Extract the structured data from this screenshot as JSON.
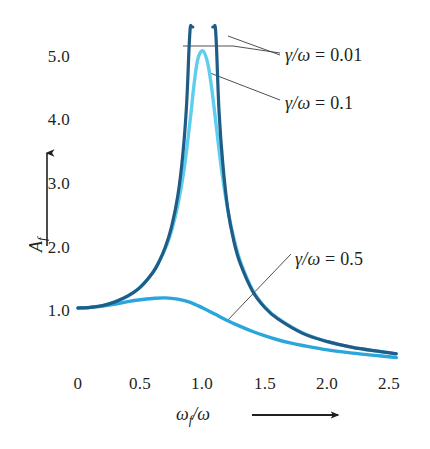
{
  "chart_data": {
    "type": "line",
    "title": "",
    "xlabel": "ωf/ω",
    "ylabel": "Af",
    "xlim": [
      0,
      2.6
    ],
    "ylim": [
      0,
      5.6
    ],
    "grid": false,
    "legend_position": "inline-annotations",
    "x_ticks": [
      "0",
      "0.5",
      "1.0",
      "1.5",
      "2.0",
      "2.5"
    ],
    "x_tick_values": [
      0,
      0.5,
      1.0,
      1.5,
      2.0,
      2.5
    ],
    "y_ticks": [
      "1.0",
      "2.0",
      "3.0",
      "4.0",
      "5.0"
    ],
    "y_tick_values": [
      1.0,
      2.0,
      3.0,
      4.0,
      5.0
    ],
    "series": [
      {
        "name": "γ/ω = 0.01",
        "gamma_over_omega": 0.01,
        "color": "#1f5c86",
        "peak_x": 1.0,
        "peak_y": 50.0,
        "clipped_at_top": true,
        "x": [
          0.0,
          0.1,
          0.2,
          0.3,
          0.4,
          0.5,
          0.6,
          0.65,
          0.7,
          0.75,
          0.8,
          0.84,
          0.87,
          0.89,
          0.9,
          0.91,
          0.92,
          1.08,
          1.09,
          1.1,
          1.11,
          1.13,
          1.16,
          1.2,
          1.25,
          1.3,
          1.4,
          1.5,
          1.6,
          1.8,
          2.0,
          2.2,
          2.4,
          2.55
        ],
        "y": [
          1.0,
          1.01,
          1.04,
          1.1,
          1.19,
          1.33,
          1.56,
          1.73,
          1.96,
          2.28,
          2.77,
          3.42,
          4.2,
          5.1,
          5.6,
          5.6,
          5.6,
          5.6,
          5.6,
          5.6,
          5.1,
          4.1,
          3.28,
          2.56,
          2.04,
          1.7,
          1.26,
          1.0,
          0.83,
          0.6,
          0.47,
          0.38,
          0.32,
          0.28
        ]
      },
      {
        "name": "γ/ω = 0.1",
        "gamma_over_omega": 0.1,
        "color": "#5ecdee",
        "peak_x": 1.0,
        "peak_y": 5.05,
        "clipped_at_top": false,
        "x": [
          0.0,
          0.1,
          0.2,
          0.3,
          0.4,
          0.5,
          0.6,
          0.7,
          0.75,
          0.8,
          0.85,
          0.9,
          0.93,
          0.96,
          1.0,
          1.04,
          1.07,
          1.1,
          1.15,
          1.2,
          1.25,
          1.3,
          1.4,
          1.5,
          1.6,
          1.8,
          2.0,
          2.2,
          2.4,
          2.55
        ],
        "y": [
          1.0,
          1.01,
          1.04,
          1.1,
          1.19,
          1.33,
          1.56,
          1.94,
          2.22,
          2.62,
          3.18,
          3.98,
          4.52,
          4.92,
          5.05,
          4.85,
          4.48,
          4.0,
          3.18,
          2.55,
          2.09,
          1.74,
          1.28,
          1.01,
          0.84,
          0.61,
          0.47,
          0.38,
          0.32,
          0.28
        ]
      },
      {
        "name": "γ/ω = 0.5",
        "gamma_over_omega": 0.5,
        "color": "#2ba6dd",
        "peak_x": 0.7,
        "peak_y": 1.16,
        "clipped_at_top": false,
        "x": [
          0.0,
          0.1,
          0.2,
          0.3,
          0.4,
          0.5,
          0.6,
          0.7,
          0.8,
          0.9,
          1.0,
          1.1,
          1.2,
          1.3,
          1.4,
          1.5,
          1.6,
          1.7,
          1.8,
          2.0,
          2.2,
          2.4,
          2.55
        ],
        "y": [
          1.0,
          1.01,
          1.03,
          1.06,
          1.1,
          1.13,
          1.15,
          1.16,
          1.14,
          1.09,
          1.0,
          0.9,
          0.8,
          0.71,
          0.63,
          0.56,
          0.5,
          0.45,
          0.41,
          0.34,
          0.29,
          0.25,
          0.22
        ]
      }
    ]
  },
  "axes": {
    "y_label_main": "A",
    "y_label_sub": "f",
    "x_label_main_1": "ω",
    "x_label_sub": "f",
    "x_label_main_2": "/ω"
  },
  "annotations": [
    {
      "id": "annot-001",
      "text_symbol": "γ/ω",
      "text_equals": "= 0.01",
      "full_text": "γ/ω = 0.01",
      "series": "γ/ω = 0.01"
    },
    {
      "id": "annot-01",
      "text_symbol": "γ/ω",
      "text_equals": "= 0.1",
      "full_text": "γ/ω = 0.1",
      "series": "γ/ω = 0.1"
    },
    {
      "id": "annot-05",
      "text_symbol": "γ/ω",
      "text_equals": "= 0.5",
      "full_text": "γ/ω = 0.5",
      "series": "γ/ω = 0.5"
    }
  ],
  "colors": {
    "curve_dark": "#1f5c86",
    "curve_light": "#5ecdee",
    "curve_medium": "#2ba6dd",
    "text": "#231f20",
    "leader": "#3c3c3c",
    "background": "#ffffff"
  }
}
